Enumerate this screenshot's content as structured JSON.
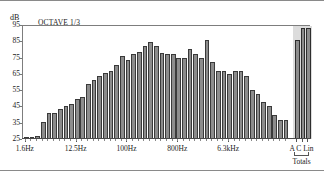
{
  "header": {
    "unit_label": "dB",
    "mode_label": "OCTAVE 1/3"
  },
  "axes": {
    "y_ticks": [
      "95",
      "85",
      "75",
      "65",
      "55",
      "45",
      "35",
      "25"
    ],
    "x_tick_labels": [
      "1.6Hz",
      "12.5Hz",
      "100Hz",
      "800Hz",
      "6.3kHz"
    ],
    "totals_names": "A C Lin",
    "totals_caption": "Totals"
  },
  "colors": {
    "bar_fill": "#8c8c8c",
    "bar_stroke": "#3a3a3a",
    "totals_band": "#dcdcdc",
    "frame": "#7d7d7d",
    "text": "#1a1a1a"
  },
  "chart_data": {
    "type": "bar",
    "title": "OCTAVE 1/3",
    "xlabel": "",
    "ylabel": "dB",
    "ylim": [
      25,
      95
    ],
    "grid": false,
    "legend": null,
    "y_tick_values": [
      25,
      35,
      45,
      55,
      65,
      75,
      85,
      95
    ],
    "x_tick_labels": [
      "1.6Hz",
      "12.5Hz",
      "100Hz",
      "800Hz",
      "6.3kHz"
    ],
    "x_tick_band_index": [
      0,
      9,
      18,
      27,
      36
    ],
    "categories": [
      "1.6Hz",
      "2Hz",
      "2.5Hz",
      "3.15Hz",
      "4Hz",
      "5Hz",
      "6.3Hz",
      "8Hz",
      "10Hz",
      "12.5Hz",
      "16Hz",
      "20Hz",
      "25Hz",
      "31.5Hz",
      "40Hz",
      "50Hz",
      "63Hz",
      "80Hz",
      "100Hz",
      "125Hz",
      "160Hz",
      "200Hz",
      "250Hz",
      "315Hz",
      "400Hz",
      "500Hz",
      "630Hz",
      "800Hz",
      "1kHz",
      "1.25kHz",
      "1.6kHz",
      "2kHz",
      "2.5kHz",
      "3.15kHz",
      "4kHz",
      "5kHz",
      "6.3kHz",
      "8kHz",
      "10kHz",
      "12.5kHz",
      "16kHz",
      "20kHz"
    ],
    "values": [
      25.2,
      25.5,
      26.8,
      35.2,
      41.0,
      41.2,
      43.5,
      45.5,
      46.5,
      49.5,
      50.5,
      58.5,
      61.0,
      63.5,
      65.5,
      67.0,
      70.5,
      76.0,
      73.5,
      77.0,
      78.5,
      82.0,
      84.5,
      82.0,
      78.0,
      77.0,
      77.0,
      74.8,
      75.0,
      80.5,
      77.5,
      74.5,
      86.0,
      72.5,
      67.0,
      66.5,
      65.0,
      66.5,
      66.5,
      63.5,
      55.0,
      52.5
    ],
    "tail_values": [
      48.0,
      45.0,
      40.0,
      36.5,
      36.5
    ],
    "tail_categories": [
      "25kHz",
      "31.5kHz",
      "40kHz",
      "50kHz",
      "63kHz"
    ],
    "totals": {
      "categories": [
        "A",
        "C",
        "Lin"
      ],
      "values": [
        85.5,
        93.0,
        93.0
      ]
    }
  }
}
